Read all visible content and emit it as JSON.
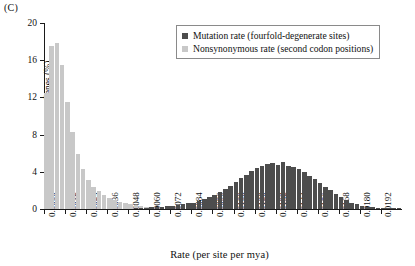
{
  "panel": {
    "label": "(C)"
  },
  "legend": {
    "position": "top-right",
    "entries": [
      {
        "label": "Mutation rate (fourfold-degenerate sites)",
        "color": "#4d4d4d",
        "swatch_icon": "square-swatch"
      },
      {
        "label": "Nonsynonymous rate (second codon positions)",
        "color": "#c8c8c8",
        "swatch_icon": "square-swatch"
      }
    ]
  },
  "axes": {
    "x_title": "Rate (per site per mya)",
    "y_title": "Genes (%)",
    "y_ticks": [
      0,
      4,
      8,
      12,
      16,
      20
    ],
    "y_tick_labels": [
      "0",
      "4",
      "8",
      "12",
      "16",
      "20"
    ],
    "x_ticks": [
      0.0,
      0.0012,
      0.0024,
      0.0036,
      0.0048,
      0.006,
      0.0072,
      0.0084,
      0.0096,
      0.0108,
      0.012,
      0.0132,
      0.0144,
      0.0156,
      0.0168,
      0.018,
      0.0192
    ],
    "x_tick_labels": [
      "0.0000",
      "0.0012",
      "0.0024",
      "0.0036",
      "0.0048",
      "0.0060",
      "0.0072",
      "0.0084",
      "0.0096",
      "0.0108",
      "0.0120",
      "0.0132",
      "0.0144",
      "0.0156",
      "0.0168",
      "0.0180",
      "0.0192"
    ]
  },
  "chart_data": {
    "type": "bar",
    "title": "",
    "subtitle": "",
    "xlabel": "Rate (per site per mya)",
    "ylabel": "Genes (%)",
    "xlim": [
      0.0,
      0.0204
    ],
    "ylim": [
      0,
      20
    ],
    "grid": false,
    "legend_position": "top-right",
    "bin_width": 0.0003,
    "x": [
      0.0,
      0.0003,
      0.0006,
      0.0009,
      0.0012,
      0.0015,
      0.0018,
      0.0021,
      0.0024,
      0.0027,
      0.003,
      0.0033,
      0.0036,
      0.0039,
      0.0042,
      0.0045,
      0.0048,
      0.0051,
      0.0054,
      0.0057,
      0.006,
      0.0063,
      0.0066,
      0.0069,
      0.0072,
      0.0075,
      0.0078,
      0.0081,
      0.0084,
      0.0087,
      0.009,
      0.0093,
      0.0096,
      0.0099,
      0.0102,
      0.0105,
      0.0108,
      0.0111,
      0.0114,
      0.0117,
      0.012,
      0.0123,
      0.0126,
      0.0129,
      0.0132,
      0.0135,
      0.0138,
      0.0141,
      0.0144,
      0.0147,
      0.015,
      0.0153,
      0.0156,
      0.0159,
      0.0162,
      0.0165,
      0.0168,
      0.0171,
      0.0174,
      0.0177,
      0.018,
      0.0183,
      0.0186,
      0.0189,
      0.0192,
      0.0195,
      0.0198,
      0.0201
    ],
    "series": [
      {
        "name": "Nonsynonymous rate (second codon positions)",
        "color": "#c8c8c8",
        "values": [
          12.5,
          17.5,
          17.8,
          15.5,
          11.5,
          8.3,
          5.9,
          4.3,
          3.1,
          2.4,
          1.9,
          1.5,
          1.2,
          0.95,
          0.75,
          0.6,
          0.5,
          0.4,
          0.3,
          0.25,
          0.2,
          0.15,
          0.12,
          0.1,
          0.08,
          0.06,
          0.05,
          0.04,
          0.03,
          0.03,
          0.02,
          0.02,
          0.02,
          0.01,
          0.01,
          0.01,
          0.01,
          0.01,
          0.0,
          0.0,
          0.0,
          0.0,
          0.0,
          0.0,
          0.0,
          0.0,
          0.0,
          0.0,
          0.0,
          0.0,
          0.0,
          0.0,
          0.0,
          0.0,
          0.0,
          0.0,
          0.0,
          0.0,
          0.0,
          0.0,
          0.0,
          0.0,
          0.0,
          0.0,
          0.0,
          0.0,
          0.0,
          0.0
        ]
      },
      {
        "name": "Mutation rate (fourfold-degenerate sites)",
        "color": "#4d4d4d",
        "values": [
          0.0,
          0.0,
          0.0,
          0.0,
          0.0,
          0.0,
          0.0,
          0.0,
          0.0,
          0.0,
          0.0,
          0.0,
          0.0,
          0.0,
          0.0,
          0.0,
          0.0,
          0.05,
          0.1,
          0.15,
          0.2,
          0.2,
          0.25,
          0.3,
          0.35,
          0.4,
          0.5,
          0.6,
          0.7,
          0.9,
          1.1,
          1.3,
          1.55,
          1.8,
          2.1,
          2.5,
          2.9,
          3.3,
          3.7,
          4.1,
          4.4,
          4.6,
          4.85,
          5.0,
          4.75,
          5.05,
          4.6,
          4.55,
          4.3,
          4.0,
          3.6,
          3.2,
          2.8,
          2.4,
          2.0,
          1.6,
          1.25,
          0.95,
          0.7,
          0.5,
          0.35,
          0.25,
          0.18,
          0.12,
          0.08,
          0.05,
          0.04,
          0.12
        ]
      }
    ]
  }
}
